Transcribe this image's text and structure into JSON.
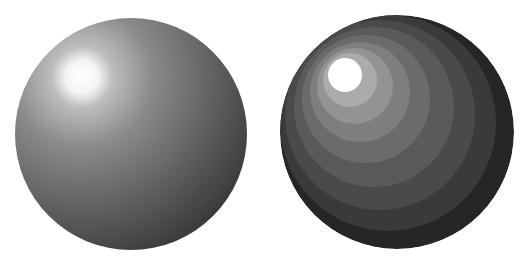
{
  "figure": {
    "background_color": "#ffffff",
    "spheres": [
      {
        "name": "smooth-shaded-sphere",
        "shading": "smooth",
        "cx": 131,
        "cy": 134,
        "r": 116,
        "highlight": {
          "cx": 82,
          "cy": 77,
          "r": 18
        },
        "colors": {
          "highlight": "#ffffff",
          "mid": "#6a6a6a",
          "edge": "#1e1e1e"
        }
      },
      {
        "name": "banded-shaded-sphere",
        "shading": "banded",
        "cx": 397,
        "cy": 132,
        "r": 117,
        "highlight": {
          "cx": 345,
          "cy": 75,
          "r": 17
        },
        "bands": [
          {
            "color": "#262626"
          },
          {
            "color": "#3a3a3a"
          },
          {
            "color": "#4a4a4a"
          },
          {
            "color": "#5a5a5a"
          },
          {
            "color": "#6b6b6b"
          },
          {
            "color": "#7e7e7e"
          },
          {
            "color": "#939393"
          },
          {
            "color": "#ababab"
          },
          {
            "color": "#ffffff"
          }
        ]
      }
    ]
  }
}
